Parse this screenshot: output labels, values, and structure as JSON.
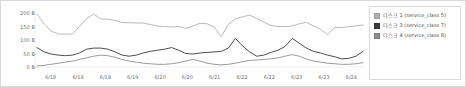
{
  "chart_data": {
    "type": "line",
    "title": "",
    "xlabel": "",
    "ylabel": "",
    "ylim": [
      0,
      200
    ],
    "grid": false,
    "legend_position": "right",
    "ytick_labels": [
      "200 B",
      "150 B",
      "100 B",
      "50 B",
      "0 B"
    ],
    "ytick_values": [
      200,
      150,
      100,
      50,
      0
    ],
    "xtick_labels": [
      "6/18",
      "6/18",
      "6/19",
      "6/19",
      "6/20",
      "6/20",
      "6/21",
      "6/22",
      "6/22",
      "6/23",
      "6/23",
      "6/24"
    ],
    "x": [
      0,
      1,
      2,
      3,
      4,
      5,
      6,
      7,
      8,
      9,
      10,
      11,
      12,
      13,
      14,
      15,
      16,
      17,
      18,
      19,
      20,
      21,
      22,
      23,
      24,
      25,
      26,
      27,
      28,
      29,
      30,
      31,
      32,
      33,
      34,
      35,
      36,
      37,
      38,
      39,
      40,
      41,
      42,
      43,
      44,
      45,
      46
    ],
    "series": [
      {
        "name": "디스크 1 (service_class 5)",
        "color": "#b0b0b0",
        "values": [
          196,
          160,
          133,
          122,
          122,
          122,
          150,
          180,
          196,
          178,
          177,
          172,
          165,
          164,
          163,
          163,
          157,
          152,
          150,
          148,
          150,
          143,
          152,
          162,
          160,
          148,
          112,
          158,
          178,
          186,
          192,
          180,
          166,
          154,
          150,
          150,
          152,
          160,
          166,
          152,
          140,
          120,
          146,
          146,
          150,
          152,
          156
        ]
      },
      {
        "name": "디스크 3 (service_class 7)",
        "color": "#3a3a3a",
        "values": [
          72,
          56,
          48,
          44,
          42,
          44,
          52,
          66,
          70,
          70,
          66,
          56,
          44,
          40,
          44,
          52,
          58,
          62,
          66,
          72,
          62,
          50,
          48,
          52,
          54,
          56,
          58,
          70,
          106,
          78,
          56,
          40,
          44,
          54,
          62,
          76,
          106,
          88,
          70,
          58,
          52,
          44,
          38,
          30,
          32,
          40,
          58
        ]
      },
      {
        "name": "디스크 4 (service_class 8)",
        "color": "#8e8e8e",
        "values": [
          4,
          6,
          10,
          14,
          18,
          22,
          28,
          34,
          40,
          44,
          42,
          36,
          28,
          22,
          18,
          14,
          12,
          10,
          10,
          12,
          16,
          22,
          28,
          22,
          14,
          10,
          8,
          10,
          14,
          20,
          24,
          26,
          28,
          30,
          34,
          40,
          46,
          40,
          30,
          22,
          18,
          14,
          12,
          10,
          10,
          12,
          16
        ]
      }
    ]
  }
}
